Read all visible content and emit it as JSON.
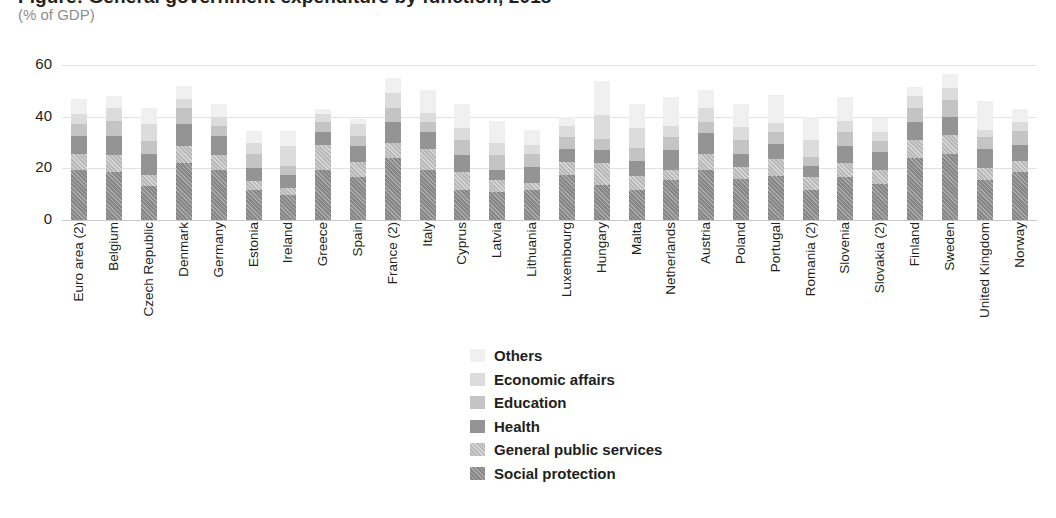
{
  "header": {
    "title": "Figure: General government expenditure by function, 2018",
    "subtitle": "(% of GDP)"
  },
  "chart_data": {
    "type": "bar",
    "stacked": true,
    "title": "Figure: General government expenditure by function, 2018",
    "subtitle": "(% of GDP)",
    "xlabel": "",
    "ylabel": "",
    "ylim": [
      0,
      60
    ],
    "yticks": [
      0,
      20,
      40,
      60
    ],
    "grid": true,
    "legend_position": "bottom-center",
    "categories": [
      "Euro area (2)",
      "Belgium",
      "Czech Republic",
      "Denmark",
      "Germany",
      "Estonia",
      "Ireland",
      "Greece",
      "Spain",
      "France (2)",
      "Italy",
      "Cyprus",
      "Latvia",
      "Lithuania",
      "Luxembourg",
      "Hungary",
      "Malta",
      "Netherlands",
      "Austria",
      "Poland",
      "Portugal",
      "Romania (2)",
      "Slovenia",
      "Slovakia (2)",
      "Finland",
      "Sweden",
      "United Kingdom",
      "Norway"
    ],
    "series": [
      {
        "name": "Social protection",
        "values": [
          19.5,
          18.5,
          13.0,
          22.0,
          19.5,
          11.5,
          9.5,
          19.5,
          16.5,
          24.0,
          19.5,
          11.5,
          11.0,
          11.5,
          17.5,
          13.5,
          11.5,
          15.5,
          19.5,
          16.0,
          17.0,
          11.5,
          16.5,
          14.0,
          24.0,
          25.5,
          15.5,
          18.5
        ]
      },
      {
        "name": "General public services",
        "values": [
          6.0,
          6.5,
          4.5,
          6.5,
          5.5,
          3.5,
          3.0,
          9.5,
          6.0,
          6.0,
          8.0,
          7.0,
          4.5,
          3.0,
          5.0,
          8.5,
          5.5,
          4.0,
          6.0,
          4.5,
          6.5,
          5.0,
          5.5,
          5.5,
          7.0,
          7.5,
          4.5,
          4.5
        ]
      },
      {
        "name": "Health",
        "values": [
          7.0,
          7.5,
          8.0,
          8.5,
          7.5,
          5.0,
          5.0,
          5.0,
          6.0,
          8.0,
          6.5,
          6.5,
          4.0,
          6.0,
          5.0,
          5.0,
          6.0,
          7.5,
          8.0,
          5.0,
          6.0,
          4.5,
          6.5,
          7.0,
          7.0,
          7.0,
          7.5,
          6.0
        ]
      },
      {
        "name": "Education",
        "values": [
          4.5,
          6.0,
          5.0,
          6.5,
          4.0,
          5.5,
          3.5,
          4.0,
          4.0,
          5.5,
          4.0,
          6.0,
          5.5,
          5.0,
          4.5,
          4.5,
          5.0,
          5.0,
          4.5,
          5.5,
          4.5,
          3.5,
          5.5,
          4.0,
          5.5,
          6.5,
          4.5,
          5.5
        ]
      },
      {
        "name": "Economic affairs",
        "values": [
          4.0,
          5.0,
          6.5,
          3.5,
          3.5,
          4.5,
          7.5,
          3.0,
          4.5,
          5.5,
          3.5,
          4.5,
          5.0,
          3.5,
          4.5,
          9.0,
          7.5,
          4.5,
          5.5,
          5.0,
          3.5,
          6.5,
          4.5,
          3.5,
          4.5,
          4.5,
          3.0,
          3.5
        ]
      },
      {
        "name": "Others",
        "values": [
          6.0,
          4.5,
          6.5,
          5.0,
          5.0,
          4.5,
          6.0,
          2.0,
          2.0,
          6.0,
          9.0,
          9.5,
          8.5,
          6.0,
          3.5,
          13.5,
          9.5,
          11.0,
          7.0,
          9.0,
          11.0,
          9.0,
          9.0,
          5.5,
          3.5,
          5.5,
          11.0,
          5.0
        ]
      }
    ],
    "totals": [
      47.0,
      48.0,
      43.5,
      52.0,
      45.0,
      34.5,
      34.5,
      43.0,
      39.0,
      55.0,
      50.5,
      45.0,
      38.5,
      35.0,
      40.0,
      54.0,
      45.0,
      47.5,
      50.5,
      45.0,
      48.5,
      40.0,
      47.5,
      39.5,
      51.5,
      56.5,
      46.0,
      43.0
    ]
  },
  "legend": {
    "items": [
      {
        "label": "Others",
        "swatch": "others-swatch"
      },
      {
        "label": "Economic affairs",
        "swatch": "economic-affairs-swatch"
      },
      {
        "label": "Education",
        "swatch": "education-swatch"
      },
      {
        "label": "Health",
        "swatch": "health-swatch"
      },
      {
        "label": "General public services",
        "swatch": "general-public-services-swatch"
      },
      {
        "label": "Social protection",
        "swatch": "social-protection-swatch"
      }
    ]
  },
  "colors": {
    "others": "#f0f0f0",
    "economic_affairs": "#dcdcdc",
    "education": "#c4c4c4",
    "health": "#949494",
    "general_public_services": "#b9b9b9",
    "social_protection": "#878787",
    "gridline": "#e2e2e2",
    "text": "#231f20",
    "subtitle": "#8d8d8d"
  }
}
